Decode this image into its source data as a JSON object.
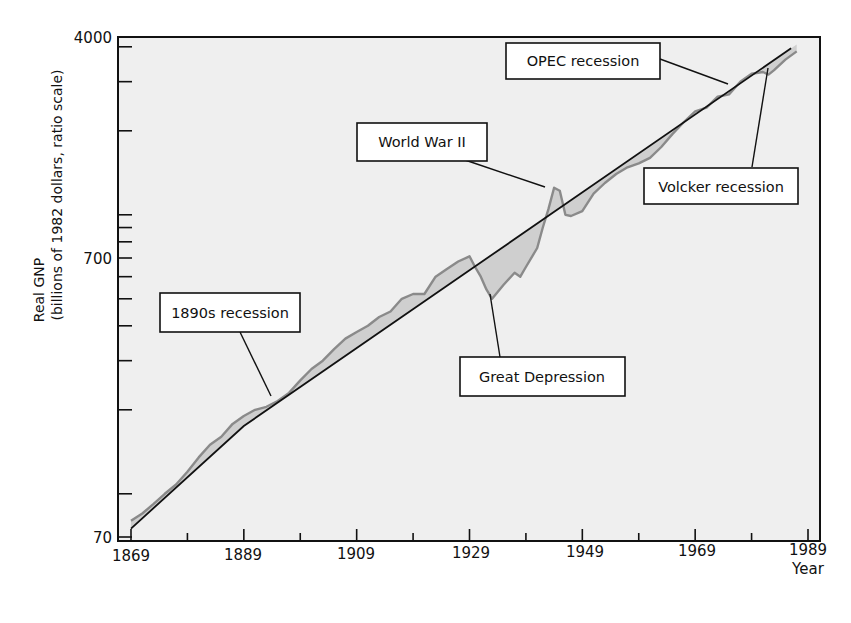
{
  "chart_data": {
    "type": "line",
    "title": "",
    "xlabel": "Year",
    "ylabel": "Real GNP",
    "ylabel_sub": "(billions of 1982 dollars, ratio scale)",
    "yscale": "log",
    "xlim": [
      1866,
      1989
    ],
    "ylim": [
      70,
      4000
    ],
    "grid": false,
    "legend": null,
    "x_ticks": [
      1869,
      1889,
      1909,
      1929,
      1949,
      1969,
      1989
    ],
    "x_minor_ticks": [
      1879,
      1899,
      1919,
      1939,
      1959,
      1979
    ],
    "y_tick_labels": [
      70,
      700,
      4000
    ],
    "y_minor_ticks": [
      100,
      200,
      300,
      400,
      500,
      600,
      800,
      900,
      1000,
      2000,
      3000
    ],
    "series": [
      {
        "name": "Real GNP",
        "style": "gray wavy line with shaded deviation from trend",
        "x": [
          1869,
          1871,
          1873,
          1875,
          1877,
          1879,
          1881,
          1883,
          1885,
          1887,
          1889,
          1891,
          1893,
          1895,
          1897,
          1899,
          1901,
          1903,
          1905,
          1907,
          1909,
          1911,
          1913,
          1915,
          1917,
          1919,
          1921,
          1923,
          1925,
          1927,
          1929,
          1930,
          1931,
          1932,
          1933,
          1935,
          1937,
          1938,
          1939,
          1941,
          1942,
          1943,
          1944,
          1945,
          1946,
          1947,
          1949,
          1951,
          1953,
          1955,
          1957,
          1959,
          1961,
          1963,
          1965,
          1967,
          1969,
          1971,
          1973,
          1975,
          1977,
          1979,
          1981,
          1982,
          1983,
          1985,
          1987
        ],
        "values": [
          80,
          85,
          92,
          100,
          108,
          120,
          135,
          150,
          160,
          178,
          190,
          200,
          205,
          215,
          230,
          255,
          280,
          300,
          330,
          360,
          380,
          400,
          430,
          450,
          500,
          520,
          520,
          600,
          640,
          680,
          710,
          650,
          600,
          540,
          500,
          560,
          620,
          600,
          650,
          760,
          900,
          1050,
          1250,
          1220,
          1000,
          990,
          1030,
          1190,
          1300,
          1400,
          1480,
          1530,
          1600,
          1750,
          1950,
          2150,
          2350,
          2420,
          2650,
          2700,
          3000,
          3200,
          3250,
          3180,
          3300,
          3600,
          3850
        ]
      },
      {
        "name": "Trend",
        "style": "solid black straight line (trend growth)",
        "x": [
          1869,
          1889,
          1986
        ],
        "values": [
          75,
          175,
          3950
        ]
      }
    ],
    "annotations": [
      {
        "label": "1890s recession",
        "x": 1895,
        "y": 225
      },
      {
        "label": "Great Depression",
        "x": 1933,
        "y": 500
      },
      {
        "label": "World War II",
        "x": 1944,
        "y": 1250
      },
      {
        "label": "OPEC recession",
        "x": 1975,
        "y": 2720
      },
      {
        "label": "Volcker recession",
        "x": 1982,
        "y": 3180
      }
    ]
  },
  "labels": {
    "ylabel_line1": "Real GNP",
    "ylabel_line2": "(billions of 1982 dollars, ratio scale)",
    "xlabel": "Year",
    "ytick_top": "4000",
    "ytick_mid": "700",
    "ytick_bot": "70",
    "xticks": [
      "1869",
      "1889",
      "1909",
      "1929",
      "1949",
      "1969",
      "1989"
    ],
    "annotations": {
      "recession_1890s": "1890s recession",
      "great_depression": "Great Depression",
      "world_war_ii": "World War II",
      "opec_recession": "OPEC recession",
      "volcker_recession": "Volcker recession"
    }
  },
  "colors": {
    "plot_background": "#efefef",
    "axis": "#111111",
    "gnp_line": "#8a8a8a",
    "deviation_fill": "#cfcfcf",
    "trend_line": "#111111"
  }
}
